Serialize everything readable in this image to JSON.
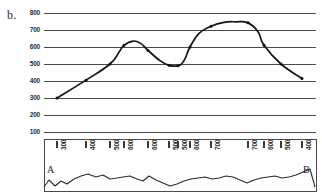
{
  "figure": {
    "panel_letter": "b.",
    "caption_a": "A",
    "caption_b": "B"
  },
  "chart_data": {
    "type": "line",
    "title": "",
    "subtitle": "",
    "xlabel": "",
    "ylabel": "",
    "grid": true,
    "legend": null,
    "ylim": [
      100,
      800
    ],
    "yticks": [
      800,
      700,
      600,
      500,
      400,
      300,
      200,
      100
    ],
    "ytick_labels": [
      "800",
      "700",
      "600",
      "500",
      "400",
      "300",
      "200",
      "100"
    ],
    "xtick_labels": [
      "300",
      "400",
      "500",
      "600",
      "600",
      "500",
      "500",
      "600",
      "700",
      "700",
      "600",
      "500",
      "400"
    ],
    "xtick_positions_px": [
      57,
      86,
      110,
      124,
      148,
      169,
      178,
      190,
      211,
      248,
      264,
      281,
      302
    ],
    "series": [
      {
        "name": "elevation-profile",
        "x": [
          57,
          86,
          110,
          119,
          124,
          133,
          141,
          148,
          160,
          169,
          178,
          184,
          190,
          199,
          211,
          224,
          236,
          248,
          258,
          264,
          281,
          302
        ],
        "values": [
          300,
          405,
          500,
          570,
          610,
          635,
          620,
          580,
          520,
          492,
          490,
          520,
          600,
          680,
          722,
          745,
          748,
          742,
          690,
          610,
          500,
          415
        ]
      }
    ],
    "terrain_profile": {
      "name": "cross-section-terrain",
      "x": [
        44,
        49,
        55,
        61,
        67,
        74,
        81,
        88,
        96,
        103,
        110,
        117,
        123,
        130,
        137,
        143,
        149,
        156,
        163,
        170,
        177,
        184,
        191,
        198,
        205,
        212,
        219,
        226,
        233,
        240,
        247,
        254,
        261,
        268,
        275,
        282,
        289,
        296,
        303,
        310,
        315
      ],
      "y": [
        187,
        180,
        186,
        181,
        184,
        179,
        176,
        174,
        177,
        175,
        179,
        178,
        177,
        176,
        179,
        181,
        176,
        180,
        183,
        186,
        184,
        181,
        179,
        178,
        177,
        179,
        178,
        176,
        177,
        180,
        183,
        180,
        178,
        177,
        176,
        178,
        177,
        175,
        172,
        169,
        187
      ]
    }
  }
}
